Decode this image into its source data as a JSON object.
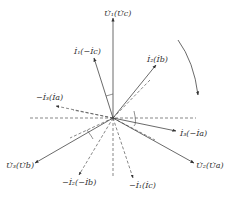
{
  "diagram": {
    "type": "phasor-diagram",
    "origin": [
      113,
      118
    ],
    "colors": {
      "line": "#444444",
      "dashed": "#555555",
      "text": "#333333",
      "background": "#ffffff"
    },
    "solid_phasors": [
      {
        "id": "U1",
        "label": "U̇₁(U̇c)",
        "tip": [
          113,
          18
        ],
        "label_pos": [
          104,
          16
        ]
      },
      {
        "id": "I1",
        "label": "İ₁(−İc)",
        "tip": [
          94,
          58
        ],
        "label_pos": [
          74,
          54
        ]
      },
      {
        "id": "I2",
        "label": "İ₂(İb)",
        "tip": [
          156,
          65
        ],
        "label_pos": [
          147,
          62
        ]
      },
      {
        "id": "I3",
        "label": "İ₃(−İa)",
        "tip": [
          176,
          131
        ],
        "label_pos": [
          180,
          136
        ]
      },
      {
        "id": "U2",
        "label": "U̇₂(U̇a)",
        "tip": [
          194,
          163
        ],
        "label_pos": [
          196,
          168
        ]
      },
      {
        "id": "U3",
        "label": "U̇₃(U̇b)",
        "tip": [
          35,
          163
        ],
        "label_pos": [
          6,
          168
        ]
      }
    ],
    "dashed_phasors": [
      {
        "id": "-I3",
        "label": "−İ₃(İa)",
        "tip": [
          56,
          106
        ],
        "label_pos": [
          36,
          100
        ]
      },
      {
        "id": "-I2",
        "label": "−İ₂(−İb)",
        "tip": [
          79,
          175
        ],
        "label_pos": [
          62,
          185
        ]
      },
      {
        "id": "-I1",
        "label": "−İ₁(İc)",
        "tip": [
          133,
          178
        ],
        "label_pos": [
          129,
          188
        ]
      }
    ],
    "reference_lines": [
      {
        "from": [
          30,
          118
        ],
        "to": [
          196,
          118
        ]
      },
      {
        "from": [
          113,
          118
        ],
        "to": [
          113,
          178
        ]
      },
      {
        "from": [
          113,
          118
        ],
        "to": [
          150,
          80
        ]
      },
      {
        "from": [
          113,
          118
        ],
        "to": [
          73,
          110
        ]
      },
      {
        "from": [
          113,
          118
        ],
        "to": [
          70,
          138
        ]
      },
      {
        "from": [
          113,
          118
        ],
        "to": [
          155,
          140
        ]
      }
    ],
    "rotation_arrow": {
      "direction": "clockwise",
      "from": [
        178,
        40
      ],
      "to": [
        198,
        95
      ]
    }
  }
}
